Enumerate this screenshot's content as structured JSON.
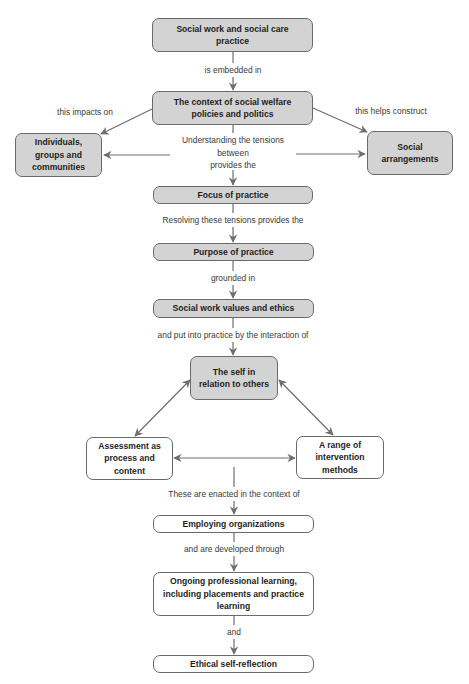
{
  "nodes": {
    "social_work_practice": "Social work and social care practice",
    "context_welfare": "The context of social welfare policies and politics",
    "individuals": "Individuals, groups and communities",
    "social_arrangements": "Social arrangements",
    "focus": "Focus of practice",
    "purpose": "Purpose of practice",
    "values_ethics": "Social work values and ethics",
    "self_relation": "The self in relation to others",
    "assessment": "Assessment as process and content",
    "intervention": "A range of intervention methods",
    "employing": "Employing organizations",
    "ongoing_learning": "Ongoing professional learning, including placements and practice learning",
    "ethical_reflection": "Ethical self-reflection"
  },
  "edges": {
    "embedded": "is embedded in",
    "impacts": "this impacts on",
    "constructs": "this helps construct",
    "tensions_line1": "Understanding the tensions",
    "tensions_line2": "between",
    "tensions_line3": "provides the",
    "resolving": "Resolving these tensions provides the",
    "grounded": "grounded in",
    "put_into_practice": "and put into practice by the interaction of",
    "enacted": "These are enacted in the context of",
    "developed": "and are developed through",
    "and": "and"
  },
  "colors": {
    "grey_fill": "#d3d3d3",
    "white_fill": "#ffffff",
    "border": "#6a6a6a",
    "arrow": "#6e6e6e",
    "node_text": "#1e1e1e",
    "label_text": "#3a3a3a"
  }
}
